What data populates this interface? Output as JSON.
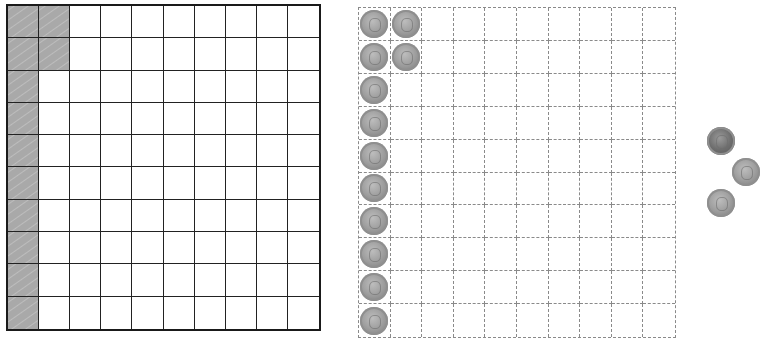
{
  "figure": {
    "left_grid": {
      "rows": 10,
      "cols": 10,
      "shaded_cells": [
        [
          1,
          1
        ],
        [
          1,
          2
        ],
        [
          2,
          1
        ],
        [
          2,
          2
        ],
        [
          3,
          1
        ],
        [
          4,
          1
        ],
        [
          5,
          1
        ],
        [
          6,
          1
        ],
        [
          7,
          1
        ],
        [
          8,
          1
        ],
        [
          9,
          1
        ],
        [
          10,
          1
        ]
      ],
      "shaded_count": 12,
      "shade_color": "#aaaaaa",
      "line_style": "solid"
    },
    "right_grid": {
      "rows": 10,
      "cols": 10,
      "coin_cells": [
        [
          1,
          1
        ],
        [
          1,
          2
        ],
        [
          2,
          1
        ],
        [
          2,
          2
        ],
        [
          3,
          1
        ],
        [
          4,
          1
        ],
        [
          5,
          1
        ],
        [
          6,
          1
        ],
        [
          7,
          1
        ],
        [
          8,
          1
        ],
        [
          9,
          1
        ],
        [
          10,
          1
        ]
      ],
      "coin_count": 12,
      "line_style": "dashed"
    },
    "loose_coins": [
      {
        "x": 707,
        "y": 127,
        "tone": "dark"
      },
      {
        "x": 732,
        "y": 158,
        "tone": "light"
      },
      {
        "x": 707,
        "y": 189,
        "tone": "light"
      }
    ]
  }
}
